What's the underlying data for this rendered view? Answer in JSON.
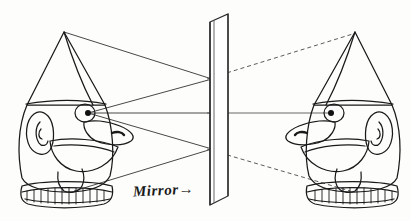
{
  "figure": {
    "type": "optics-ray-diagram"
  },
  "labels": {
    "mirror": "Mirror",
    "mirror_arrow": "→"
  },
  "colors": {
    "ink": "#1a1a1a",
    "ray": "#333333",
    "dashed_ray": "#4a4a4a",
    "paper": "#fdfdfb"
  },
  "objects": {
    "real_figure": {
      "name": "real-figure",
      "side": "left",
      "facing": "right",
      "hat_apex": [
        64,
        32
      ],
      "eye_pupil": [
        88,
        113
      ],
      "parts": [
        "cone-hat",
        "hat-brim",
        "head",
        "ear",
        "eye",
        "nose",
        "mouth",
        "chin",
        "ruffled-collar"
      ]
    },
    "virtual_figure": {
      "name": "virtual-figure",
      "side": "right",
      "facing": "left",
      "hat_apex": [
        355,
        32
      ],
      "eye_pupil": [
        331,
        113
      ],
      "parts": [
        "cone-hat",
        "hat-brim",
        "head",
        "ear",
        "eye",
        "nose",
        "mouth",
        "chin",
        "ruffled-collar"
      ]
    },
    "mirror": {
      "name": "mirror-plate",
      "surface_x": 210,
      "top_y": 18,
      "bottom_y": 205,
      "thickness": 6,
      "skew": 18
    }
  },
  "rays": {
    "incident": [
      {
        "name": "ray-hat-to-mirror-upper",
        "from": [
          64,
          32
        ],
        "to": [
          210,
          78
        ],
        "style": "solid"
      },
      {
        "name": "ray-eye-to-mirror-upper",
        "from": [
          88,
          113
        ],
        "to": [
          210,
          78
        ],
        "style": "solid"
      },
      {
        "name": "ray-eye-to-mirror-center",
        "from": [
          88,
          113
        ],
        "to": [
          210,
          113
        ],
        "style": "solid"
      },
      {
        "name": "ray-eye-to-mirror-lower",
        "from": [
          88,
          113
        ],
        "to": [
          210,
          148
        ],
        "style": "solid"
      },
      {
        "name": "ray-collar-to-mirror-lower",
        "from": [
          72,
          190
        ],
        "to": [
          210,
          148
        ],
        "style": "solid"
      }
    ],
    "virtual": [
      {
        "name": "virtual-ray-upper",
        "from": [
          210,
          78
        ],
        "to": [
          355,
          32
        ],
        "style": "dashed"
      },
      {
        "name": "virtual-ray-center",
        "from": [
          210,
          113
        ],
        "to": [
          331,
          113
        ],
        "style": "solid"
      },
      {
        "name": "virtual-ray-lower",
        "from": [
          210,
          148
        ],
        "to": [
          350,
          190
        ],
        "style": "dashed"
      }
    ]
  }
}
